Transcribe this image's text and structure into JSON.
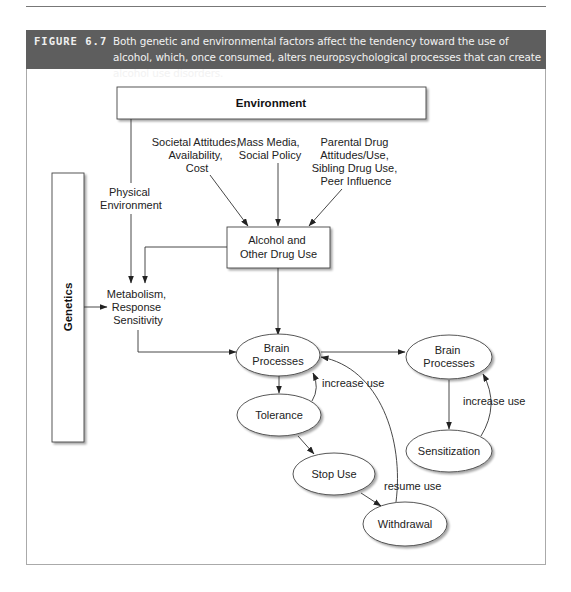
{
  "figure": {
    "label": "FIGURE 6.7",
    "caption": "Both genetic and environmental factors affect the tendency toward the use of alcohol, which, once consumed, alters neuropsychological processes that can create alcohol use disorders.",
    "header_bg": "#5e5e5e"
  },
  "diagram": {
    "environment": "Environment",
    "genetics": "Genetics",
    "physical_environment": [
      "Physical",
      "Environment"
    ],
    "societal": [
      "Societal Attitudes,",
      "Availability,",
      "Cost"
    ],
    "mass_media": [
      "Mass Media,",
      "Social Policy"
    ],
    "parental": [
      "Parental Drug",
      "Attitudes/Use,",
      "Sibling Drug Use,",
      "Peer Influence"
    ],
    "alcohol_use": [
      "Alcohol and",
      "Other Drug Use"
    ],
    "metabolism": [
      "Metabolism,",
      "Response",
      "Sensitivity"
    ],
    "brain_processes_1": [
      "Brain",
      "Processes"
    ],
    "brain_processes_2": [
      "Brain",
      "Processes"
    ],
    "tolerance": "Tolerance",
    "stop_use": "Stop Use",
    "withdrawal": "Withdrawal",
    "sensitization": "Sensitization",
    "increase_use_1": "increase use",
    "increase_use_2": "increase use",
    "resume_use": "resume use"
  }
}
